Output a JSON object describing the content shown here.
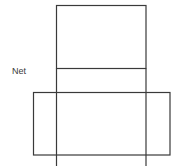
{
  "diagram": {
    "label": "Net",
    "stroke_color": "#3a3a3a",
    "background": "#ffffff",
    "shape": "box net (unfolded cuboid)",
    "lines": {
      "central_strip": {
        "x1": 56,
        "x2": 146,
        "y_top": 5,
        "y_bottom": 166
      },
      "top_face": {
        "x": 56,
        "y": 5,
        "width": 90,
        "height": 63
      },
      "middle_divider_y": 68,
      "flap_row": {
        "x": 33,
        "y": 92,
        "width": 137,
        "height": 63
      }
    }
  }
}
